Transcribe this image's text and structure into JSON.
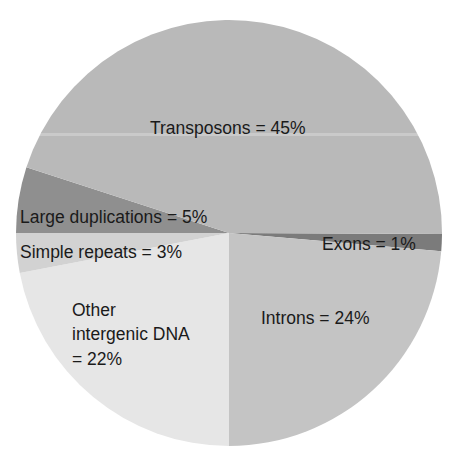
{
  "chart_data": {
    "type": "pie",
    "title": "",
    "slices": [
      {
        "label": "Exons",
        "value": 1,
        "text": "Exons = 1%",
        "color": "#7b7b7b",
        "start_deg": 0.3,
        "end_deg": 4.9
      },
      {
        "label": "Introns",
        "value": 24,
        "text": "Introns = 24%",
        "color": "#c4c4c4",
        "start_deg": 4.9,
        "end_deg": 90
      },
      {
        "label": "Other intergenic DNA",
        "value": 22,
        "text_lines": [
          "Other",
          "intergenic DNA",
          "= 22%"
        ],
        "color": "#e6e6e6",
        "start_deg": 90,
        "end_deg": 169.2
      },
      {
        "label": "Simple repeats",
        "value": 3,
        "text": "Simple repeats = 3%",
        "color": "#d2d2d2",
        "start_deg": 169.2,
        "end_deg": 180
      },
      {
        "label": "Large duplications",
        "value": 5,
        "text": "Large duplications = 5%",
        "color": "#8f8f8f",
        "start_deg": 180,
        "end_deg": 198
      },
      {
        "label": "Transposons",
        "value": 45,
        "text": "Transposons = 45%",
        "color": "#b9b9b9",
        "start_deg": 198,
        "end_deg": 360.3
      }
    ],
    "categories": [
      "Transposons",
      "Introns",
      "Other intergenic DNA",
      "Large duplications",
      "Simple repeats",
      "Exons"
    ],
    "values": [
      45,
      24,
      22,
      5,
      3,
      1
    ],
    "units": "%",
    "legend": "none (labels drawn inside slices)",
    "geometry": {
      "cx": 229,
      "cy": 233,
      "r": 213
    }
  }
}
